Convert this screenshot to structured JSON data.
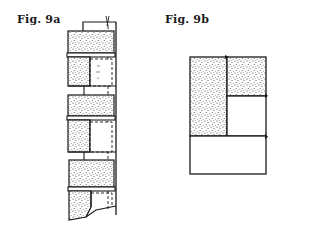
{
  "figures": {
    "a": {
      "label": "Fig. 9a",
      "description": "Vertical folded strip with three stippled blocks, each with a fold line and dashed hidden edges"
    },
    "b": {
      "label": "Fig. 9b",
      "description": "Rectangle divided into stippled left column, stippled top-right cell, blank middle-right cell and blank bottom strip"
    }
  },
  "colors": {
    "ink": "#1a1a1a",
    "paper": "#ffffff",
    "stipple": "#3a3a3a"
  }
}
